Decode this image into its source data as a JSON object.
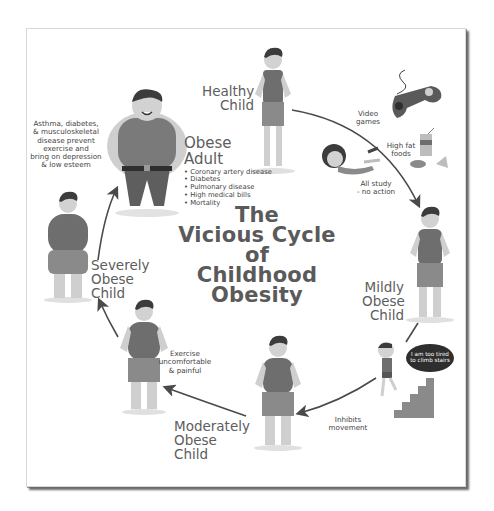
{
  "title": {
    "lines": [
      "The",
      "Vicious Cycle",
      "of",
      "Childhood",
      "Obesity"
    ]
  },
  "stages": {
    "healthy_child": {
      "line1": "Healthy",
      "line2": "Child"
    },
    "mildly_obese": {
      "line1": "Mildly",
      "line2": "Obese",
      "line3": "Child"
    },
    "moderately_obese": {
      "line1": "Moderately",
      "line2": "Obese Child"
    },
    "severely_obese": {
      "line1": "Severely",
      "line2": "Obese Child"
    },
    "obese_adult": {
      "line1": "Obese",
      "line2": "Adult",
      "risks": [
        "Coronary artery disease",
        "Diabetes",
        "Pulmonary disease",
        "High medical bills",
        "Mortality"
      ]
    }
  },
  "causes": {
    "video_games": [
      "Video",
      "games"
    ],
    "high_fat_foods": [
      "High fat",
      "foods"
    ],
    "all_study": [
      "All study",
      "- no action"
    ],
    "inhibits_movement": [
      "Inhibits",
      "movement"
    ],
    "exercise_painful": [
      "Exercise",
      "uncomfortable",
      "& painful"
    ],
    "adult_conditions": [
      "Asthma, diabetes,",
      "& musculoskeletal",
      "disease prevent",
      "exercise and",
      "bring on depression",
      "& low esteem"
    ]
  },
  "speech_bubble": "I am too tired to climb stairs",
  "colors": {
    "text": "#5d5d5d",
    "title": "#5a5a5a",
    "arrow": "#4a4a4a",
    "shirt": "#6e6e6e",
    "skin": "#c9c9c9",
    "shorts": "#8a8a8a",
    "hair": "#3c3c3c",
    "shadow": "#d6d6d6"
  }
}
